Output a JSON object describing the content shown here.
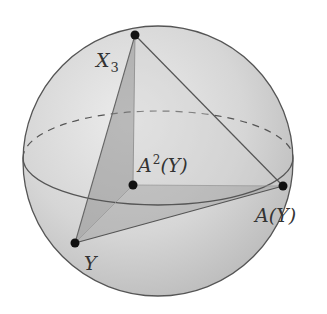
{
  "diagram": {
    "type": "sphere-with-triangle",
    "sphere": {
      "cx": 158,
      "cy": 161,
      "r": 135,
      "fill": "#d4d4d4",
      "stroke": "#555555"
    },
    "equator": {
      "cx": 158,
      "cy": 158,
      "rx": 135,
      "ry": 47,
      "back_style": "dashed",
      "front_style": "solid"
    },
    "points": [
      {
        "id": "X3",
        "x": 135,
        "y": 35
      },
      {
        "id": "A2Y",
        "x": 133,
        "y": 185
      },
      {
        "id": "AY",
        "x": 283,
        "y": 186
      },
      {
        "id": "Y",
        "x": 75,
        "y": 243
      }
    ],
    "labels": {
      "x3_main": "X",
      "x3_sub": "3",
      "a2y_main": "A",
      "a2y_sup": "2",
      "a2y_arg": "(Y)",
      "ay_main": "A(Y)",
      "y_main": "Y"
    },
    "colors": {
      "face_dark": "#9a9a9a",
      "face_light": "#b9b9b9",
      "edge": "#555555",
      "point": "#111111"
    }
  }
}
